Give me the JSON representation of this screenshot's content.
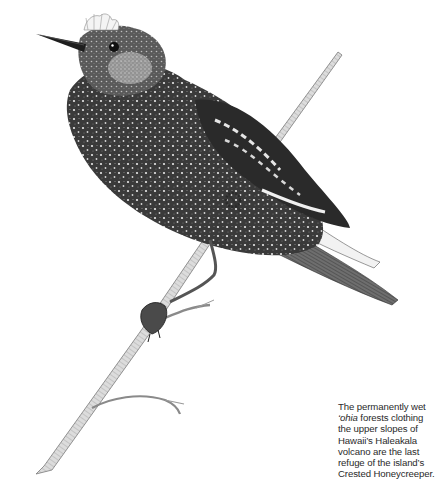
{
  "illustration": {
    "subject": "Crested Honeycreeper perched on a branch",
    "style": "pen-and-ink stipple drawing",
    "colors": {
      "ink": "#2b2b2b",
      "dark": "#1a1a1a",
      "mid": "#6b6b6b",
      "light": "#bdbdbd",
      "paper": "#ffffff"
    }
  },
  "caption": {
    "lead": "The permanently wet",
    "italic_word": "‘ohia",
    "rest_line2": " forests clothing",
    "line3": "the upper slopes of",
    "line4": "Hawaii’s Haleakala",
    "line5": "volcano are the last",
    "line6": "refuge of the island’s",
    "line7": "Crested Honeycreeper."
  }
}
